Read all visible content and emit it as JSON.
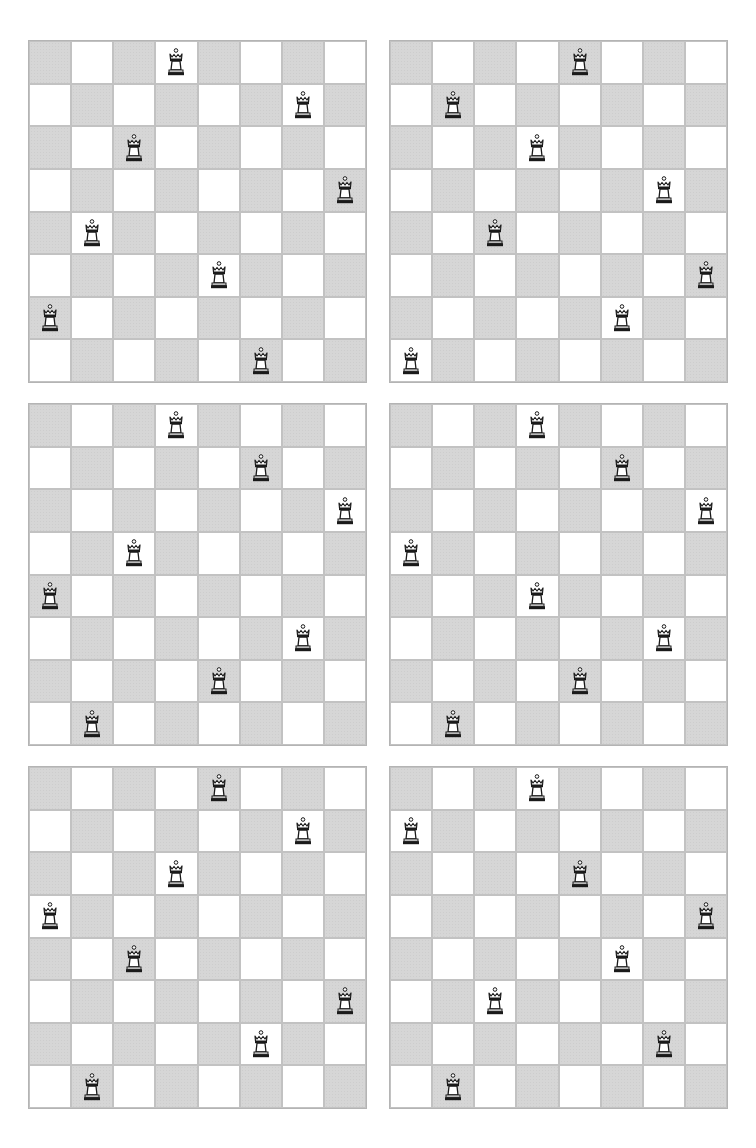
{
  "colors": {
    "light_square": "#ffffff",
    "dark_square": "#d6d6d6",
    "grid_line": "#c2c2c2",
    "piece": "#1a1a1a"
  },
  "piece_icon": "queen-icon",
  "boards": [
    {
      "id": "board-1",
      "left": 28,
      "top": 40,
      "queens": [
        3,
        6,
        2,
        7,
        1,
        4,
        0,
        5
      ]
    },
    {
      "id": "board-2",
      "left": 389,
      "top": 40,
      "queens": [
        4,
        1,
        3,
        6,
        2,
        7,
        5,
        0
      ]
    },
    {
      "id": "board-3",
      "left": 28,
      "top": 403,
      "queens": [
        3,
        5,
        7,
        2,
        0,
        6,
        4,
        1
      ]
    },
    {
      "id": "board-4",
      "left": 389,
      "top": 403,
      "queens": [
        3,
        5,
        7,
        0,
        3,
        6,
        4,
        1
      ]
    },
    {
      "id": "board-5",
      "left": 28,
      "top": 766,
      "queens": [
        4,
        6,
        3,
        0,
        2,
        7,
        5,
        1
      ]
    },
    {
      "id": "board-6",
      "left": 389,
      "top": 766,
      "queens": [
        3,
        0,
        4,
        7,
        5,
        2,
        6,
        1
      ]
    }
  ]
}
